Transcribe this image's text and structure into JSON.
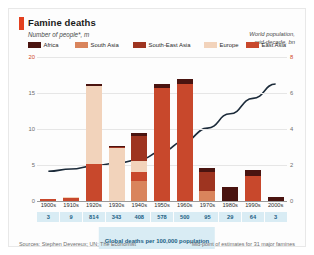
{
  "header": {
    "title": "Famine deaths",
    "subtitle": "Number of people*, m",
    "right_axis_label": "World population,\nmid-decade, bn",
    "accent_color": "#e3401f"
  },
  "legend": {
    "items": [
      {
        "label": "Africa",
        "color": "#4a1410"
      },
      {
        "label": "South Asia",
        "color": "#d9845c"
      },
      {
        "label": "South-East Asia",
        "color": "#9e3420"
      },
      {
        "label": "Europe",
        "color": "#f2d3bb"
      },
      {
        "label": "East Asia",
        "color": "#c8482c"
      }
    ]
  },
  "footer": {
    "banner": "Global deaths per 100,000 population",
    "source": "Sources: Stephen Devereux; UN; The Economist",
    "note": "*Mid-point of estimates for 31 major famines"
  },
  "chart_data": {
    "type": "bar",
    "title": "Famine deaths",
    "xlabel": "",
    "ylabel": "Number of people*, m",
    "ylim": [
      0,
      20
    ],
    "yticks": [
      0,
      5,
      10,
      15,
      20
    ],
    "y2label": "World population, mid-decade, bn",
    "y2lim": [
      0,
      8
    ],
    "y2ticks": [
      0,
      2,
      4,
      6,
      8
    ],
    "grid": true,
    "legend_position": "top",
    "categories": [
      "1900s",
      "1910s",
      "1920s",
      "1930s",
      "1940s",
      "1950s",
      "1960s",
      "1970s",
      "1980s",
      "1990s",
      "2000s"
    ],
    "series": [
      {
        "name": "South Asia",
        "color": "#d9845c",
        "values": [
          0.0,
          0.0,
          0.0,
          0.0,
          2.8,
          0.0,
          0.0,
          1.4,
          0.0,
          0.0,
          0.0
        ]
      },
      {
        "name": "East Asia",
        "color": "#c8482c",
        "values": [
          0.3,
          0.4,
          5.2,
          0.0,
          1.2,
          15.7,
          16.3,
          0.0,
          0.0,
          3.5,
          0.0
        ]
      },
      {
        "name": "Europe",
        "color": "#f2d3bb",
        "values": [
          0.0,
          0.2,
          10.8,
          7.4,
          1.6,
          0.0,
          0.0,
          0.0,
          0.0,
          0.0,
          0.0
        ]
      },
      {
        "name": "South-East Asia",
        "color": "#9e3420",
        "values": [
          0.0,
          0.0,
          0.0,
          0.1,
          3.4,
          0.0,
          0.0,
          2.6,
          0.0,
          0.0,
          0.0
        ]
      },
      {
        "name": "Africa",
        "color": "#4a1410",
        "values": [
          0.0,
          0.0,
          0.2,
          0.1,
          0.5,
          0.5,
          0.6,
          0.6,
          2.0,
          0.8,
          0.5
        ]
      }
    ],
    "line": {
      "name": "World population, mid-decade, bn",
      "color": "#1c2b3a",
      "axis": "right",
      "values": [
        1.65,
        1.78,
        1.95,
        2.1,
        2.3,
        2.75,
        3.35,
        4.05,
        4.85,
        5.7,
        6.5
      ]
    },
    "deaths_per_100k": [
      3,
      9,
      814,
      343,
      408,
      578,
      500,
      95,
      29,
      64,
      3
    ]
  }
}
